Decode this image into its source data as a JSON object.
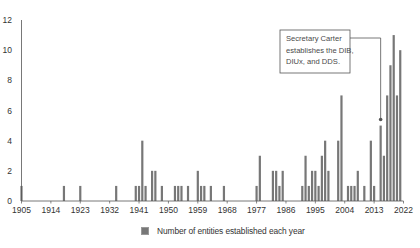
{
  "chart_data": {
    "type": "bar",
    "title": "",
    "xlabel": "",
    "ylabel": "",
    "xlim": [
      1905,
      2022
    ],
    "ylim": [
      0,
      12
    ],
    "grid": false,
    "legend_position": "bottom-center",
    "x_ticks": [
      1905,
      1914,
      1923,
      1932,
      1941,
      1950,
      1959,
      1968,
      1977,
      1986,
      1995,
      2004,
      2013,
      2022
    ],
    "y_ticks": [
      0,
      2,
      4,
      6,
      8,
      10,
      12
    ],
    "series": [
      {
        "name": "Number of entities established each year",
        "color": "#777777",
        "x": [
          1905,
          1918,
          1923,
          1934,
          1940,
          1941,
          1942,
          1943,
          1945,
          1946,
          1948,
          1952,
          1953,
          1954,
          1956,
          1959,
          1960,
          1961,
          1963,
          1967,
          1977,
          1978,
          1982,
          1983,
          1984,
          1985,
          1991,
          1992,
          1993,
          1994,
          1995,
          1996,
          1997,
          1998,
          1999,
          2002,
          2003,
          2005,
          2006,
          2007,
          2008,
          2010,
          2012,
          2013,
          2015,
          2016,
          2017,
          2018,
          2019,
          2020,
          2021
        ],
        "values": [
          1,
          1,
          1,
          1,
          1,
          1,
          4,
          1,
          2,
          2,
          1,
          1,
          1,
          1,
          1,
          2,
          1,
          1,
          1,
          1,
          1,
          3,
          2,
          2,
          1,
          2,
          1,
          3,
          1,
          2,
          2,
          1,
          3,
          4,
          2,
          4,
          7,
          1,
          1,
          1,
          2,
          1,
          4,
          1,
          5,
          3,
          7,
          9,
          11,
          7,
          10
        ]
      }
    ],
    "annotations": [
      {
        "text_lines": [
          "Secretary Carter",
          "establishes the DIB,",
          "DIUx, and DDS."
        ],
        "points_to_year": 2015
      }
    ]
  },
  "legend": {
    "label": "Number of entities established each year",
    "swatch_color": "#777777"
  },
  "colors": {
    "bar": "#777777",
    "axis": "#555555",
    "text": "#333333",
    "annotation_border": "#555555"
  }
}
